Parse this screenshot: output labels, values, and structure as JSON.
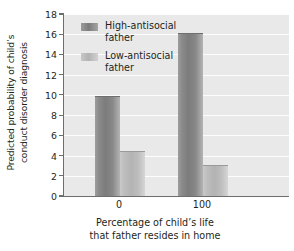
{
  "chart_data": {
    "type": "bar",
    "title": "",
    "subtitle": "",
    "categories": [
      "0",
      "100"
    ],
    "series": [
      {
        "name": "High-antisocial father",
        "values": [
          9.8,
          16.0
        ],
        "color": "#808080"
      },
      {
        "name": "Low-antisocial father",
        "values": [
          4.4,
          3.0
        ],
        "color": "#c0c0c0"
      }
    ],
    "xlabel": "Percentage of child's life that father resides in home",
    "xlabel_lines": [
      "Percentage of child’s life",
      "that father resides in home"
    ],
    "ylabel": "Predicted probability of child's conduct disorder diagnosis",
    "ylabel_lines": [
      "Predicted probability of child’s",
      "conduct disorder diagnosis"
    ],
    "ylim": [
      0,
      18
    ],
    "ytick_values": [
      0,
      2,
      4,
      6,
      8,
      10,
      12,
      14,
      16,
      18
    ],
    "ytick_labels": [
      "0",
      "2",
      "4",
      "6",
      "8",
      "10",
      "12",
      "14",
      "16",
      "18"
    ],
    "grid": "horizontal",
    "legend_position": "top-left",
    "plot_background": "#e9e9e9",
    "gridline_color": "#ffffff",
    "axis_color": "#6d6d6d"
  },
  "legend": {
    "items": [
      {
        "label_lines": [
          "High-antisocial",
          "father"
        ],
        "swatch": "high"
      },
      {
        "label_lines": [
          "Low-antisocial",
          "father"
        ],
        "swatch": "low"
      }
    ]
  }
}
